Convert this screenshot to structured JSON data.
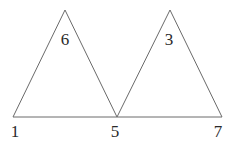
{
  "diagram": {
    "type": "two-triangles-sharing-vertex",
    "stroke_color": "#6a6a6a",
    "text_color": "#2a2a2a",
    "triangles": [
      {
        "name": "left-triangle",
        "apex_label": "6",
        "vertices": [
          [
            13,
            117
          ],
          [
            65,
            10
          ],
          [
            117,
            117
          ]
        ]
      },
      {
        "name": "right-triangle",
        "apex_label": "3",
        "vertices": [
          [
            117,
            117
          ],
          [
            170,
            10
          ],
          [
            222,
            117
          ]
        ]
      }
    ],
    "base_labels": [
      {
        "text": "1",
        "x": 15,
        "y": 137
      },
      {
        "text": "5",
        "x": 115,
        "y": 137
      },
      {
        "text": "7",
        "x": 218,
        "y": 137
      }
    ],
    "apex_labels": [
      {
        "text": "6",
        "x": 65,
        "y": 45
      },
      {
        "text": "3",
        "x": 169,
        "y": 45
      }
    ]
  }
}
